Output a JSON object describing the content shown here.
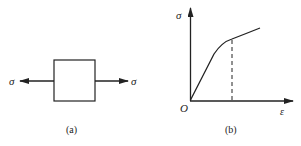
{
  "figure_a": {
    "caption": "(a)",
    "left_label": "σ",
    "right_label": "σ"
  },
  "figure_b": {
    "caption": "(b)",
    "y_axis_label": "σ",
    "x_axis_label": "ε",
    "origin_label": "O"
  },
  "colors": {
    "stroke": "#222222",
    "background": "#ffffff"
  }
}
